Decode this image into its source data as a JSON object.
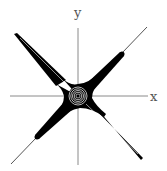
{
  "figure": {
    "axes": {
      "x_label": "x",
      "y_label": "y"
    },
    "colors": {
      "background": "#ffffff",
      "axis": "#8a8a8a",
      "curve": "#000000",
      "highlight": "#ffffff",
      "label": "#555555"
    },
    "curve": {
      "shape": "four-armed star along diagonals with concentric rings at origin",
      "arms": [
        "north-east",
        "north-west",
        "south-west",
        "south-east"
      ]
    }
  }
}
